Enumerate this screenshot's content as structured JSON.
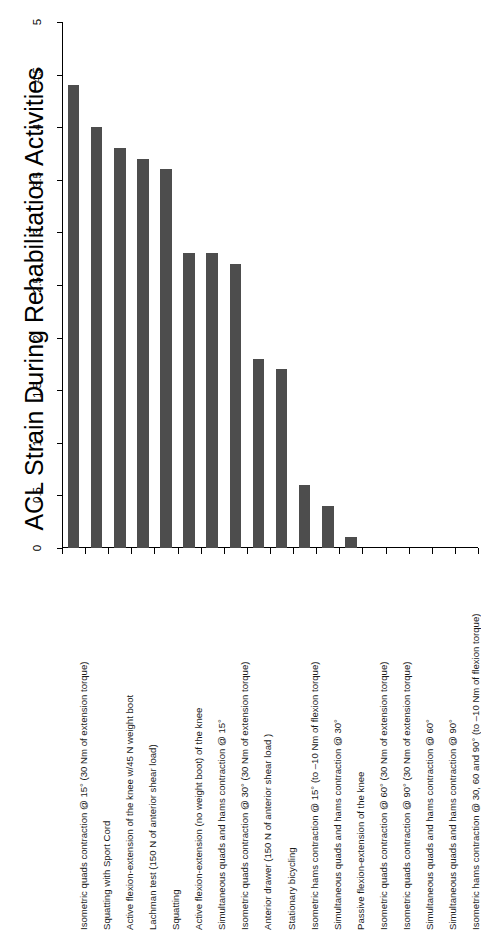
{
  "chart_data": {
    "type": "bar",
    "title": "ACL Strain During Rehabilitation Activities",
    "xlabel": "",
    "ylabel": "",
    "ylim": [
      0,
      5
    ],
    "grid": false,
    "legend": false,
    "orientation": "vertical-bars-rotated-page",
    "tick_labels": [
      "0",
      "0.5",
      "1",
      "1.5",
      "2",
      "2.5",
      "3",
      "3.5",
      "4",
      "4.5",
      "5"
    ],
    "tick_values": [
      0,
      0.5,
      1,
      1.5,
      2,
      2.5,
      3,
      3.5,
      4,
      4.5,
      5
    ],
    "bar_color": "#4d4d4d",
    "categories": [
      "Isometric quads contraction @ 15° (30 Nm of extension torque)",
      "Squatting with Sport Cord",
      "Active flexion-extension of the knee w/45 N weight boot",
      "Lachman test (150 N of anterior shear load)",
      "Squatting",
      "Active flexion-extension (no weight boot) of the knee",
      "Simultaneous quads and hams contraction @ 15°",
      "Isometric quads contraction @ 30° (30 Nm of extension torque)",
      "Anterior drawer (150 N of anterior shear load )",
      "Stationary bicycling",
      "Isometric hams contraction @ 15° (to –10 Nm of flexion torque)",
      "Simultaneous quads and hams contraction @ 30°",
      "Passive flexion-extension of the knee",
      "Isometric quads contraction @ 60° (30 Nm of extension torque)",
      "Isometric quads contraction @ 90° (30 Nm of extension torque)",
      "Simultaneous quads and hams contraction @ 60°",
      "Simultaneous quads and hams contraction @ 90°",
      "Isometric hams contraction @ 30, 60 and 90° (to –10 Nm of flexion torque)"
    ],
    "values": [
      4.4,
      4.0,
      3.8,
      3.7,
      3.6,
      2.8,
      2.8,
      2.7,
      1.8,
      1.7,
      0.6,
      0.4,
      0.1,
      0,
      0,
      0,
      0,
      0
    ]
  }
}
